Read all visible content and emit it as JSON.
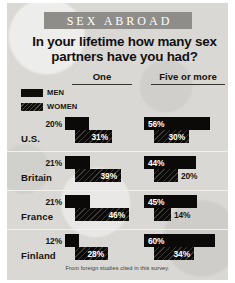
{
  "banner": {
    "title": "SEX ABROAD"
  },
  "headline": "In your lifetime how many sex partners have you had?",
  "footnote": "From foreign studies cited in this survey.",
  "legend": {
    "items": [
      {
        "label": "MEN",
        "swatch": "men-swatch",
        "color": "#0b0a08"
      },
      {
        "label": "WOMEN",
        "swatch": "women-swatch",
        "color": "#0b0a08"
      }
    ]
  },
  "columns": [
    {
      "label": "One"
    },
    {
      "label": "Five or more"
    }
  ],
  "countries": [
    {
      "label": "U.S."
    },
    {
      "label": "Britain"
    },
    {
      "label": "France"
    },
    {
      "label": "Finland"
    }
  ],
  "bars": {
    "one": {
      "men": [
        "20%",
        "21%",
        "21%",
        "12%"
      ],
      "women": [
        "31%",
        "39%",
        "46%",
        "28%"
      ]
    },
    "five_or_more": {
      "men": [
        "56%",
        "44%",
        "45%",
        "60%"
      ],
      "women": [
        "30%",
        "20%",
        "14%",
        "34%"
      ]
    }
  },
  "chart_data": {
    "type": "bar",
    "title": "In your lifetime how many sex partners have you had?",
    "subtitle": "SEX ABROAD",
    "annotation": "From foreign studies cited in this survey.",
    "xlabel": "",
    "ylabel": "Percent of respondents",
    "unit": "%",
    "xlim": [
      0,
      60
    ],
    "grid": false,
    "legend_position": "top-left",
    "orientation": "horizontal",
    "categories": [
      "U.S.",
      "Britain",
      "France",
      "Finland"
    ],
    "groups": [
      "One",
      "Five or more"
    ],
    "series": [
      {
        "name": "MEN",
        "group": "One",
        "values": [
          20,
          21,
          21,
          12
        ]
      },
      {
        "name": "WOMEN",
        "group": "One",
        "values": [
          31,
          39,
          46,
          28
        ]
      },
      {
        "name": "MEN",
        "group": "Five or more",
        "values": [
          56,
          44,
          45,
          60
        ]
      },
      {
        "name": "WOMEN",
        "group": "Five or more",
        "values": [
          30,
          20,
          14,
          34
        ]
      }
    ]
  },
  "colors": {
    "panel": "#d9d8d4",
    "banner": "#8e8d89",
    "bar": "#0b0a08",
    "text": "#16150f",
    "bar_label": "#ffffff"
  }
}
